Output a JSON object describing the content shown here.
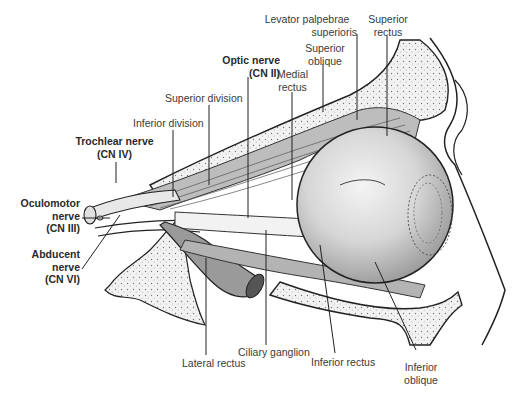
{
  "figure": {
    "labels": {
      "levator": {
        "line1": "Levator palpebrae",
        "line2": "superioris"
      },
      "superior_rectus": {
        "line1": "Superior",
        "line2": "rectus"
      },
      "superior_oblique": {
        "line1": "Superior",
        "line2": "oblique"
      },
      "optic_nerve": {
        "line1": "Optic nerve",
        "line2": "(CN II)"
      },
      "medial_rectus": {
        "line1": "Medial",
        "line2": "rectus"
      },
      "superior_division": {
        "line1": "Superior division"
      },
      "inferior_division": {
        "line1": "Inferior division"
      },
      "trochlear_nerve": {
        "line1": "Trochlear nerve",
        "line2": "(CN IV)"
      },
      "oculomotor_nerve": {
        "line1": "Oculomotor",
        "line2": "nerve",
        "line3": "(CN III)"
      },
      "abducent_nerve": {
        "line1": "Abducent",
        "line2": "nerve",
        "line3": "(CN VI)"
      },
      "lateral_rectus": {
        "line1": "Lateral rectus"
      },
      "ciliary_ganglion": {
        "line1": "Ciliary ganglion"
      },
      "inferior_rectus": {
        "line1": "Inferior rectus"
      },
      "inferior_oblique": {
        "line1": "Inferior",
        "line2": "oblique"
      }
    }
  }
}
